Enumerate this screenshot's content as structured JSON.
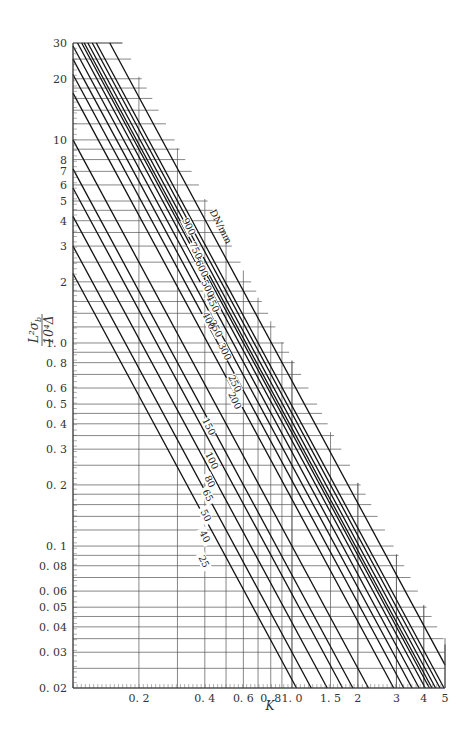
{
  "chart_data": {
    "type": "line",
    "title": "",
    "xlabel": "K",
    "ylabel": "L²σ_b / 10⁴Δ",
    "xscale": "log",
    "yscale": "log",
    "xlim": [
      0.1,
      5
    ],
    "ylim": [
      0.02,
      30
    ],
    "grid": true,
    "x_tick_labels": [
      "0.2",
      "0.4",
      "0.6",
      "0.8",
      "1.0",
      "1.5",
      "2",
      "3",
      "4",
      "5"
    ],
    "x_ticks": [
      0.2,
      0.4,
      0.6,
      0.8,
      1.0,
      1.5,
      2,
      3,
      4,
      5
    ],
    "y_tick_labels": [
      "0.02",
      "0.03",
      "0.04",
      "0.05",
      "0.06",
      "0.08",
      "0.1",
      "0.2",
      "0.3",
      "0.4",
      "0.5",
      "0.6",
      "0.8",
      "1.0",
      "2",
      "3",
      "4",
      "5",
      "6",
      "7",
      "8",
      "10",
      "20",
      "30"
    ],
    "y_ticks": [
      0.02,
      0.03,
      0.04,
      0.05,
      0.06,
      0.08,
      0.1,
      0.2,
      0.3,
      0.4,
      0.5,
      0.6,
      0.8,
      1.0,
      2,
      3,
      4,
      5,
      6,
      7,
      8,
      10,
      20,
      30
    ],
    "legend_title": "DN/mm",
    "series_note": "Each line relates y = L²σ_b/(10⁴Δ) to K for a nominal diameter DN (mm); lines are parallel in log-log space (slope ≈ -2). Values are y at K=1 read off the chart.",
    "series": [
      {
        "name": "25",
        "y_at_K_0_1": 1.3,
        "y_at_K_1": 0.022
      },
      {
        "name": "40",
        "y_at_K_0_1": 1.75,
        "y_at_K_1": 0.03
      },
      {
        "name": "50",
        "y_at_K_0_1": 2.5,
        "y_at_K_1": 0.042
      },
      {
        "name": "65",
        "y_at_K_0_1": 3.4,
        "y_at_K_1": 0.058
      },
      {
        "name": "80",
        "y_at_K_0_1": 4.2,
        "y_at_K_1": 0.072
      },
      {
        "name": "100",
        "y_at_K_0_1": 5.9,
        "y_at_K_1": 0.1
      },
      {
        "name": "150",
        "y_at_K_0_1": 9.8,
        "y_at_K_1": 0.17
      },
      {
        "name": "200",
        "y_at_K_0_1": 12.5,
        "y_at_K_1": 0.21
      },
      {
        "name": "250",
        "y_at_K_0_1": 15.0,
        "y_at_K_1": 0.25
      },
      {
        "name": "300",
        "y_at_K_0_1": 17.0,
        "y_at_K_1": 0.29
      },
      {
        "name": "350",
        "y_at_K_0_1": 19.5,
        "y_at_K_1": 0.33
      },
      {
        "name": "400",
        "y_at_K_0_1": 21.0,
        "y_at_K_1": 0.36
      },
      {
        "name": "450",
        "y_at_K_0_1": 22.5,
        "y_at_K_1": 0.38
      },
      {
        "name": "500",
        "y_at_K_0_1": 24.0,
        "y_at_K_1": 0.41
      },
      {
        "name": "600",
        "y_at_K_0_1": 26.5,
        "y_at_K_1": 0.45
      },
      {
        "name": "750",
        "y_at_K_0_1": 28.5,
        "y_at_K_1": 0.49
      },
      {
        "name": "900",
        "y_at_K_0_1": 30.0,
        "y_at_K_1": 0.65
      }
    ]
  },
  "labels": {
    "xlabel": "K",
    "ylabel_num": "L²σ",
    "ylabel_sub": "b",
    "ylabel_den": "10⁴Δ",
    "legend_title": "DN/mm"
  }
}
